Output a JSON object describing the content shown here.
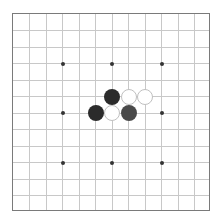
{
  "board": {
    "size": 13,
    "spacing": 16.5,
    "line_color": "#c8c8c8",
    "border_color": "#7a7a7a",
    "star_points": [
      [
        3,
        3
      ],
      [
        3,
        6
      ],
      [
        3,
        9
      ],
      [
        6,
        3
      ],
      [
        6,
        6
      ],
      [
        6,
        9
      ],
      [
        9,
        3
      ],
      [
        9,
        6
      ],
      [
        9,
        9
      ]
    ],
    "stones": [
      {
        "row": 5,
        "col": 6,
        "color": "black"
      },
      {
        "row": 5,
        "col": 7,
        "color": "white"
      },
      {
        "row": 5,
        "col": 8,
        "color": "white"
      },
      {
        "row": 6,
        "col": 5,
        "color": "black"
      },
      {
        "row": 6,
        "col": 6,
        "color": "white"
      },
      {
        "row": 6,
        "col": 7,
        "color": "gray"
      }
    ]
  }
}
